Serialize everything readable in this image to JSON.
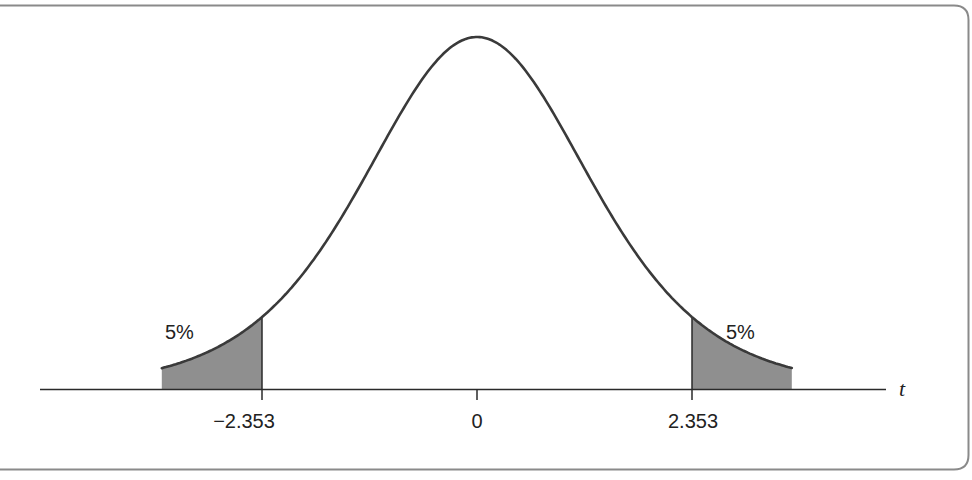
{
  "chart_data": {
    "type": "area",
    "title": "",
    "xlabel": "t",
    "ylabel": "",
    "x_ticks": [
      {
        "value": -2.353,
        "label": "−2.353"
      },
      {
        "value": 0,
        "label": "0"
      },
      {
        "value": 2.353,
        "label": "2.353"
      }
    ],
    "x_range_drawn": [
      -3.45,
      3.45
    ],
    "shaded_regions": [
      {
        "from": -3.45,
        "to": -2.353,
        "area_label": "5%",
        "side": "left"
      },
      {
        "from": 2.353,
        "to": 3.45,
        "area_label": "5%",
        "side": "right"
      }
    ],
    "tail_area_each": 0.05,
    "critical_value": 2.353,
    "grid": false,
    "legend": null
  },
  "labels": {
    "left_tail": "5%",
    "right_tail": "5%",
    "tick_left": "−2.353",
    "tick_center": "0",
    "tick_right": "2.353",
    "axis_variable": "t"
  },
  "colors": {
    "curve": "#3a3a3a",
    "shade": "#8f8f8f",
    "axis": "#2a2a2a",
    "frame": "#7a7a7a",
    "background": "#ffffff"
  }
}
